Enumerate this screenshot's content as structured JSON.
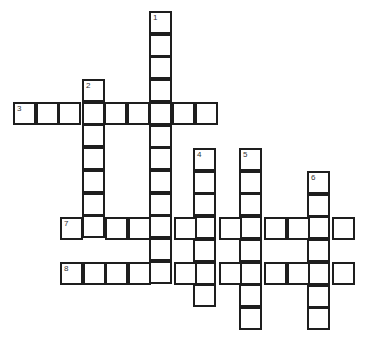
{
  "puzzle": {
    "type": "crossword",
    "cell_size": 22.7,
    "line_color": "#1e1e1e",
    "clues": [
      {
        "number": "1",
        "direction": "down",
        "col": 150,
        "row": 12,
        "length": 12
      },
      {
        "number": "2",
        "direction": "down",
        "col": 83,
        "row": 80,
        "length": 7
      },
      {
        "number": "3",
        "direction": "across",
        "col": 14,
        "row": 103,
        "length": 9
      },
      {
        "number": "4",
        "direction": "down",
        "col": 194,
        "row": 149,
        "length": 7
      },
      {
        "number": "5",
        "direction": "down",
        "col": 240,
        "row": 149,
        "length": 8
      },
      {
        "number": "6",
        "direction": "down",
        "col": 308,
        "row": 172,
        "length": 7
      },
      {
        "number": "7",
        "direction": "across",
        "col": 61,
        "row": 218,
        "length": 13
      },
      {
        "number": "8",
        "direction": "across",
        "col": 61,
        "row": 263,
        "length": 13
      }
    ]
  }
}
